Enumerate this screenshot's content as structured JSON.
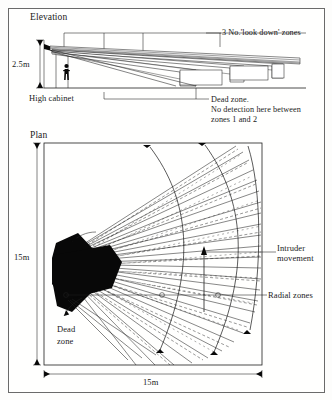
{
  "figure": {
    "type": "technical-drawing",
    "views": [
      "Elevation",
      "Plan"
    ]
  },
  "elevation": {
    "title": "Elevation",
    "height_dimension": "2.5m",
    "cabinet_label": "High cabinet",
    "zones_label": "3 No.'look down' zones",
    "zone_count": 3,
    "dead_zone_note_line1": "Dead zone.",
    "dead_zone_note_line2": "No detection here between",
    "dead_zone_note_line3": "zones 1 and 2"
  },
  "plan": {
    "title": "Plan",
    "width_dimension": "15m",
    "depth_dimension": "15m",
    "intruder_label_line1": "Intruder",
    "intruder_label_line2": "movement",
    "radial_label": "Radial zones",
    "dead_zone_line1": "Dead",
    "dead_zone_line2": "zone",
    "arc_count": 3,
    "radial_beam_count": 26
  },
  "colors": {
    "ink": "#1a1a1a",
    "frame": "#6a6a6a",
    "fill": "#080808",
    "paper": "#fffffe"
  }
}
